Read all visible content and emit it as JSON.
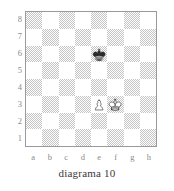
{
  "diagram": {
    "caption": "diagrama 10",
    "rank_labels": [
      "8",
      "7",
      "6",
      "5",
      "4",
      "3",
      "2",
      "1"
    ],
    "file_labels": [
      "a",
      "b",
      "c",
      "d",
      "e",
      "f",
      "g",
      "h"
    ],
    "colors": {
      "dark_square": "#c4c4c4",
      "light_square": "#ffffff",
      "border": "#9a9a9a",
      "label": "#8a8a8a",
      "caption": "#3a3a3a"
    }
  },
  "chart_data": {
    "type": "table",
    "title": "diagrama 10",
    "subtitle": "",
    "xlabel": "",
    "ylabel": "",
    "files": [
      "a",
      "b",
      "c",
      "d",
      "e",
      "f",
      "g",
      "h"
    ],
    "ranks": [
      "8",
      "7",
      "6",
      "5",
      "4",
      "3",
      "2",
      "1"
    ],
    "orientation": "white-bottom",
    "a1_square_color": "dark",
    "pieces": [
      {
        "square": "e6",
        "piece": "king",
        "color": "black",
        "glyph": "black-king-icon"
      },
      {
        "square": "e3",
        "piece": "pawn",
        "color": "white",
        "glyph": "white-pawn-icon"
      },
      {
        "square": "f3",
        "piece": "king",
        "color": "white",
        "glyph": "white-king-icon"
      }
    ],
    "fen": "8/8/4k3/8/8/4PK2/8/8",
    "piece_count": 3,
    "legend": [
      "black king e6",
      "white pawn e3",
      "white king f3"
    ],
    "grid": true
  }
}
